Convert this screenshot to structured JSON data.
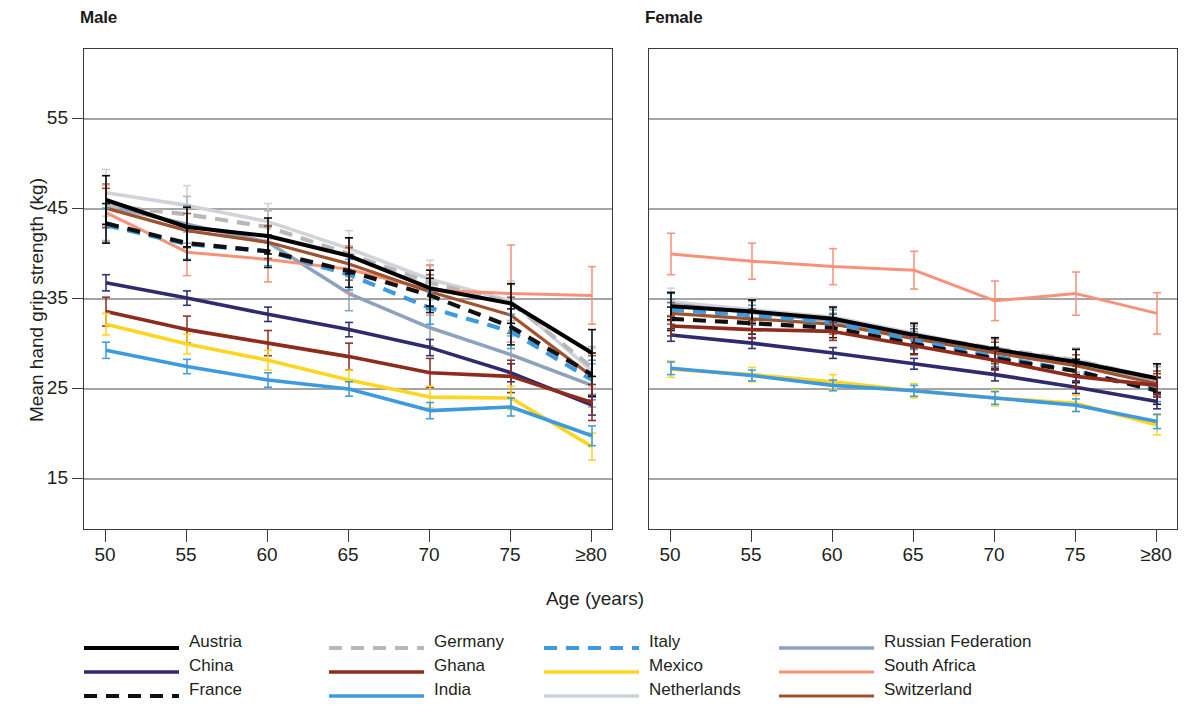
{
  "panels": [
    {
      "key": "male",
      "title": "Male"
    },
    {
      "key": "female",
      "title": "Female"
    }
  ],
  "axes": {
    "y_title": "Mean hand grip strength (kg)",
    "x_title": "Age (years)",
    "y_ticks": [
      "55",
      "45",
      "35",
      "25",
      "15"
    ],
    "x_ticks": [
      "50",
      "55",
      "60",
      "65",
      "70",
      "75",
      "≥80"
    ]
  },
  "legend": {
    "entries": [
      {
        "label": "Austria",
        "color": "#000000",
        "dash": "solid",
        "width": 4.0
      },
      {
        "label": "China",
        "color": "#2e2a6e",
        "dash": "solid",
        "width": 3.6
      },
      {
        "label": "France",
        "color": "#111111",
        "dash": "dashed",
        "width": 4.2
      },
      {
        "label": "Germany",
        "color": "#b8b8b8",
        "dash": "dashed",
        "width": 4.2
      },
      {
        "label": "Ghana",
        "color": "#8f2b1c",
        "dash": "solid",
        "width": 3.6
      },
      {
        "label": "India",
        "color": "#3d9ade",
        "dash": "solid",
        "width": 3.6
      },
      {
        "label": "Italy",
        "color": "#3d9ade",
        "dash": "dashed",
        "width": 4.2
      },
      {
        "label": "Mexico",
        "color": "#ffd520",
        "dash": "solid",
        "width": 3.6
      },
      {
        "label": "Netherlands",
        "color": "#cfd3da",
        "dash": "solid",
        "width": 3.6
      },
      {
        "label": "Russian Federation",
        "color": "#8fa2bb",
        "dash": "solid",
        "width": 3.6
      },
      {
        "label": "South Africa",
        "color": "#f79279",
        "dash": "solid",
        "width": 3.0
      },
      {
        "label": "Switzerland",
        "color": "#a0522d",
        "dash": "solid",
        "width": 3.2
      }
    ]
  },
  "chart_data": {
    "type": "line",
    "title": "",
    "xlabel": "Age (years)",
    "ylabel": "Mean hand grip strength (kg)",
    "x": [
      50,
      55,
      60,
      65,
      70,
      75,
      80
    ],
    "x_tick_labels": [
      "50",
      "55",
      "60",
      "65",
      "70",
      "75",
      "≥80"
    ],
    "xlim": [
      48,
      82
    ],
    "ylim": [
      10.4,
      63.8
    ],
    "y_ticks": [
      55,
      45,
      35,
      25,
      15
    ],
    "grid": "horizontal",
    "legend_position": "bottom",
    "error_bars": "95% CI (vertical whiskers at each age point)",
    "panels": [
      {
        "name": "Male",
        "series": [
          {
            "name": "Austria",
            "color": "#000000",
            "dash": "solid",
            "values": [
              46.0,
              43.0,
              42.0,
              39.8,
              36.2,
              34.5,
              29.0
            ],
            "ci": [
              2.7,
              2.2,
              2.0,
              2.0,
              2.0,
              2.2,
              2.6
            ]
          },
          {
            "name": "China",
            "color": "#2e2a6e",
            "dash": "solid",
            "values": [
              36.8,
              35.1,
              33.3,
              31.6,
              29.6,
              26.8,
              23.2
            ],
            "ci": [
              0.9,
              0.8,
              0.8,
              0.8,
              0.9,
              1.0,
              1.1
            ]
          },
          {
            "name": "France",
            "color": "#111111",
            "dash": "dashed",
            "values": [
              43.4,
              41.2,
              40.3,
              38.1,
              35.4,
              31.9,
              26.6
            ],
            "ci": [
              2.2,
              1.9,
              1.8,
              1.8,
              1.9,
              2.0,
              2.4
            ]
          },
          {
            "name": "Germany",
            "color": "#b8b8b8",
            "dash": "dashed",
            "values": [
              45.4,
              44.4,
              43.0,
              40.0,
              36.8,
              34.6,
              27.4
            ],
            "ci": [
              2.3,
              2.0,
              1.8,
              1.8,
              1.9,
              2.0,
              2.3
            ]
          },
          {
            "name": "Ghana",
            "color": "#8f2b1c",
            "dash": "solid",
            "values": [
              33.6,
              31.6,
              30.1,
              28.6,
              26.8,
              26.4,
              23.5
            ],
            "ci": [
              1.6,
              1.5,
              1.4,
              1.5,
              1.6,
              1.8,
              2.0
            ]
          },
          {
            "name": "India",
            "color": "#3d9ade",
            "dash": "solid",
            "values": [
              29.3,
              27.5,
              26.0,
              25.0,
              22.6,
              23.0,
              19.8
            ],
            "ci": [
              0.9,
              0.8,
              0.8,
              0.8,
              0.9,
              1.0,
              1.1
            ]
          },
          {
            "name": "Italy",
            "color": "#3d9ade",
            "dash": "dashed",
            "values": [
              43.2,
              41.1,
              40.3,
              37.7,
              34.0,
              31.4,
              26.0
            ],
            "ci": [
              1.9,
              1.7,
              1.6,
              1.7,
              1.8,
              1.9,
              2.2
            ]
          },
          {
            "name": "Mexico",
            "color": "#ffd520",
            "dash": "solid",
            "values": [
              32.2,
              30.0,
              28.2,
              26.0,
              24.1,
              24.0,
              18.6
            ],
            "ci": [
              1.2,
              1.1,
              1.1,
              1.1,
              1.2,
              1.3,
              1.5
            ]
          },
          {
            "name": "Netherlands",
            "color": "#cfd3da",
            "dash": "solid",
            "values": [
              46.8,
              45.4,
              43.6,
              40.6,
              37.2,
              34.8,
              27.0
            ],
            "ci": [
              2.6,
              2.2,
              2.0,
              2.0,
              2.1,
              2.2,
              2.5
            ]
          },
          {
            "name": "Russian Federation",
            "color": "#8fa2bb",
            "dash": "solid",
            "values": [
              45.4,
              43.3,
              41.3,
              35.6,
              31.8,
              28.8,
              25.4
            ],
            "ci": [
              2.4,
              2.1,
              1.9,
              1.9,
              2.0,
              2.1,
              2.4
            ]
          },
          {
            "name": "South Africa",
            "color": "#f79279",
            "dash": "solid",
            "values": [
              44.6,
              40.2,
              39.4,
              38.3,
              36.0,
              35.6,
              35.4
            ],
            "ci": [
              3.1,
              2.6,
              2.5,
              2.6,
              2.8,
              5.4,
              3.2
            ]
          },
          {
            "name": "Switzerland",
            "color": "#a0522d",
            "dash": "solid",
            "values": [
              45.1,
              42.6,
              41.3,
              38.9,
              35.8,
              33.2,
              26.4
            ],
            "ci": [
              2.2,
              1.9,
              1.8,
              1.8,
              1.9,
              2.0,
              2.3
            ]
          }
        ]
      },
      {
        "name": "Female",
        "series": [
          {
            "name": "Austria",
            "color": "#000000",
            "dash": "solid",
            "values": [
              34.2,
              33.6,
              32.8,
              31.0,
              29.4,
              28.0,
              26.2
            ],
            "ci": [
              1.5,
              1.3,
              1.3,
              1.3,
              1.3,
              1.4,
              1.6
            ]
          },
          {
            "name": "China",
            "color": "#2e2a6e",
            "dash": "solid",
            "values": [
              31.0,
              30.1,
              29.0,
              27.8,
              26.6,
              25.2,
              23.6
            ],
            "ci": [
              0.7,
              0.6,
              0.6,
              0.6,
              0.7,
              0.7,
              0.8
            ]
          },
          {
            "name": "France",
            "color": "#111111",
            "dash": "dashed",
            "values": [
              32.8,
              32.3,
              31.8,
              30.0,
              28.4,
              27.0,
              24.8
            ],
            "ci": [
              1.3,
              1.2,
              1.1,
              1.1,
              1.2,
              1.3,
              1.5
            ]
          },
          {
            "name": "Germany",
            "color": "#b8b8b8",
            "dash": "dashed",
            "values": [
              34.3,
              33.5,
              32.8,
              31.0,
              29.5,
              28.2,
              26.1
            ],
            "ci": [
              1.3,
              1.2,
              1.1,
              1.1,
              1.2,
              1.3,
              1.4
            ]
          },
          {
            "name": "Ghana",
            "color": "#8f2b1c",
            "dash": "solid",
            "values": [
              32.0,
              31.6,
              31.4,
              29.8,
              28.2,
              26.4,
              25.4
            ],
            "ci": [
              1.1,
              1.0,
              1.0,
              1.0,
              1.1,
              1.2,
              1.3
            ]
          },
          {
            "name": "India",
            "color": "#3d9ade",
            "dash": "solid",
            "values": [
              27.3,
              26.5,
              25.4,
              24.8,
              24.0,
              23.2,
              21.4
            ],
            "ci": [
              0.7,
              0.6,
              0.6,
              0.6,
              0.7,
              0.7,
              0.8
            ]
          },
          {
            "name": "Italy",
            "color": "#3d9ade",
            "dash": "dashed",
            "values": [
              33.8,
              33.2,
              32.4,
              30.4,
              28.6,
              27.0,
              24.9
            ],
            "ci": [
              1.2,
              1.1,
              1.0,
              1.0,
              1.1,
              1.2,
              1.3
            ]
          },
          {
            "name": "Mexico",
            "color": "#ffd520",
            "dash": "solid",
            "values": [
              27.2,
              26.6,
              25.8,
              24.8,
              24.0,
              23.4,
              21.0
            ],
            "ci": [
              0.9,
              0.8,
              0.8,
              0.8,
              0.9,
              0.9,
              1.1
            ]
          },
          {
            "name": "Netherlands",
            "color": "#cfd3da",
            "dash": "solid",
            "values": [
              34.7,
              33.8,
              33.0,
              31.2,
              29.4,
              28.2,
              26.2
            ],
            "ci": [
              1.5,
              1.3,
              1.2,
              1.2,
              1.3,
              1.4,
              1.5
            ]
          },
          {
            "name": "Russian Federation",
            "color": "#8fa2bb",
            "dash": "solid",
            "values": [
              34.4,
              33.5,
              32.6,
              30.8,
              29.2,
              28.0,
              26.0
            ],
            "ci": [
              1.4,
              1.3,
              1.2,
              1.2,
              1.3,
              1.4,
              1.5
            ]
          },
          {
            "name": "South Africa",
            "color": "#f79279",
            "dash": "solid",
            "values": [
              40.0,
              39.2,
              38.6,
              38.2,
              34.8,
              35.6,
              33.4
            ],
            "ci": [
              2.3,
              2.0,
              2.0,
              2.1,
              2.2,
              2.4,
              2.3
            ]
          },
          {
            "name": "Switzerland",
            "color": "#a0522d",
            "dash": "solid",
            "values": [
              33.4,
              32.8,
              32.2,
              30.6,
              29.0,
              27.6,
              25.6
            ],
            "ci": [
              1.2,
              1.1,
              1.1,
              1.1,
              1.2,
              1.2,
              1.4
            ]
          }
        ]
      }
    ]
  }
}
